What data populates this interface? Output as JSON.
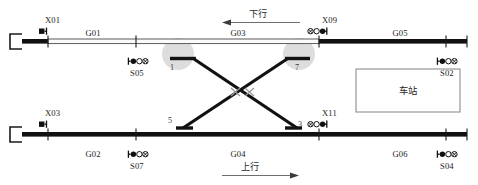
{
  "diagram": {
    "station_box_label": "车站",
    "directions": [
      {
        "name": "下行",
        "arrow": "left",
        "x": 258,
        "y": 16,
        "line_x1": 222,
        "line_x2": 300,
        "line_y": 22
      },
      {
        "name": "上行",
        "arrow": "right",
        "x": 247,
        "y": 169,
        "line_x1": 222,
        "line_x2": 300,
        "line_y": 175
      }
    ],
    "signals": [
      {
        "id": "X01",
        "label": "X01",
        "type": "left-mast",
        "label_x": 45,
        "label_y": 23,
        "sym_x": 40,
        "sym_y": 33
      },
      {
        "id": "X09",
        "label": "X09",
        "type": "right-mast-xo",
        "label_x": 322,
        "label_y": 23,
        "sym_x": 312,
        "sym_y": 33
      },
      {
        "id": "X03",
        "label": "X03",
        "type": "left-mast",
        "label_x": 45,
        "label_y": 116,
        "sym_x": 40,
        "sym_y": 126
      },
      {
        "id": "X11",
        "label": "X11",
        "type": "right-mast-xo",
        "label_x": 322,
        "label_y": 116,
        "sym_x": 312,
        "sym_y": 126
      },
      {
        "id": "S05",
        "label": "S05",
        "type": "dwarf-left",
        "label_x": 130,
        "label_y": 76,
        "sym_x": 128,
        "sym_y": 62
      },
      {
        "id": "S07",
        "label": "S07",
        "type": "dwarf-right",
        "label_x": 130,
        "label_y": 169,
        "sym_x": 128,
        "sym_y": 155
      },
      {
        "id": "S02",
        "label": "S02",
        "type": "dwarf-left",
        "label_x": 440,
        "label_y": 76,
        "sym_x": 438,
        "sym_y": 62
      },
      {
        "id": "S04",
        "label": "S04",
        "type": "dwarf-left",
        "label_x": 440,
        "label_y": 169,
        "sym_x": 438,
        "sym_y": 155
      }
    ],
    "track_segments": [
      {
        "id": "G01",
        "label": "G01",
        "x": 93,
        "y": 39
      },
      {
        "id": "G03",
        "label": "G03",
        "x": 238,
        "y": 39
      },
      {
        "id": "G05",
        "label": "G05",
        "x": 400,
        "y": 39
      },
      {
        "id": "G02",
        "label": "G02",
        "x": 93,
        "y": 159
      },
      {
        "id": "G04",
        "label": "G04",
        "x": 238,
        "y": 159
      },
      {
        "id": "G06",
        "label": "G06",
        "x": 400,
        "y": 159
      }
    ],
    "switches": [
      {
        "id": "1",
        "label": "1",
        "x": 172,
        "y": 70
      },
      {
        "id": "7",
        "label": "7",
        "x": 297,
        "y": 70
      },
      {
        "id": "5",
        "label": "5",
        "x": 170,
        "y": 123
      },
      {
        "id": "3",
        "label": "3",
        "x": 298,
        "y": 128
      }
    ],
    "colors": {
      "track_occupied": "#111111",
      "track_free": "#f2f2f2",
      "track_outline": "#3a3a3a",
      "switch_line": "#111111",
      "highlight_circle": "#cfcfcf",
      "crossing_mark": "#9a9a9a",
      "text": "#1b1b1b",
      "box_border": "#8c8c8c"
    }
  }
}
